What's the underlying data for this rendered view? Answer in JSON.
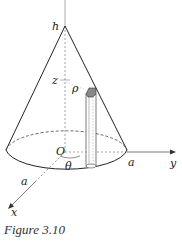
{
  "figure": {
    "caption": "Figure 3.10",
    "labels": {
      "h": "h",
      "z": "z",
      "rho": "ρ",
      "origin": "O",
      "theta": "θ",
      "a_x": "a",
      "a_y": "a",
      "x_axis": "x",
      "y_axis": "y"
    }
  }
}
